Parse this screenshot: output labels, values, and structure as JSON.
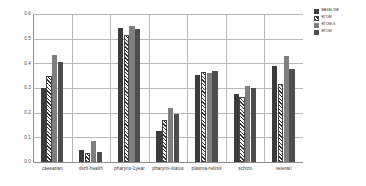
{
  "chart_data": {
    "type": "bar",
    "title": "",
    "xlabel": "",
    "ylabel": "",
    "ylim": [
      0.0,
      0.6
    ],
    "ytick_labels": [
      "0.6",
      "0.5",
      "0.4",
      "0.3",
      "0.2",
      "0.1",
      "0.0"
    ],
    "ytick_values": [
      0.6,
      0.5,
      0.4,
      0.3,
      0.2,
      0.1,
      0.0
    ],
    "grid": true,
    "legend_position": "top-right",
    "categories": [
      "caesarian",
      "dsrft-health",
      "pharynx-1year",
      "pharynx-status",
      "plasma-retinol",
      "schizo",
      "veteran"
    ],
    "series": [
      {
        "name": "BASELINE",
        "color": "#3b3b3b",
        "pattern": "solid",
        "values": [
          0.3,
          0.048,
          0.542,
          0.124,
          0.352,
          0.277,
          0.388
        ]
      },
      {
        "name": "BTOM",
        "color": "#fafafa",
        "pattern": "hatch",
        "values": [
          0.348,
          0.036,
          0.515,
          0.172,
          0.366,
          0.262,
          0.317
        ]
      },
      {
        "name": "BTOM-S",
        "color": "#7e7e7e",
        "pattern": "solid",
        "values": [
          0.433,
          0.085,
          0.553,
          0.22,
          0.36,
          0.309,
          0.43
        ]
      },
      {
        "name": "BTOM",
        "color": "#4e4e4e",
        "pattern": "solid",
        "values": [
          0.404,
          0.042,
          0.54,
          0.193,
          0.368,
          0.3,
          0.377
        ]
      }
    ]
  }
}
